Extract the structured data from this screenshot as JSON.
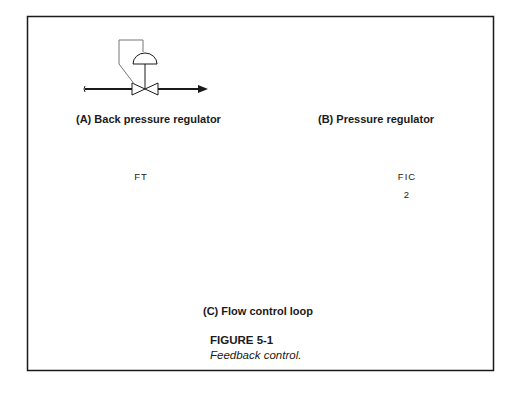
{
  "figure": {
    "number": "FIGURE 5-1",
    "caption": "Feedback control.",
    "colors": {
      "line": "#1a1a1a",
      "thin_line": "#555555",
      "frame": "#1a1a1a",
      "background": "#ffffff"
    }
  },
  "panels": [
    {
      "id": "A",
      "label": "(A)  Back pressure regulator",
      "components": [
        "pipe",
        "self-actuated valve",
        "diaphragm actuator",
        "upstream sense line",
        "flow arrow"
      ]
    },
    {
      "id": "B",
      "label": "(B)  Pressure regulator",
      "components": [
        "pipe",
        "self-actuated valve",
        "diaphragm actuator",
        "downstream sense line",
        "flow arrow"
      ]
    },
    {
      "id": "C",
      "label": "(C)  Flow control loop",
      "components": [
        "orifice plate",
        "flow transmitter",
        "square root extractor",
        "flow indicating controller",
        "control valve",
        "flow arrow"
      ]
    }
  ],
  "instruments": {
    "ft": {
      "tag": "FT"
    },
    "fic": {
      "tag": "FIC",
      "loop": "2"
    },
    "sqrt": {
      "symbol": "√"
    }
  }
}
